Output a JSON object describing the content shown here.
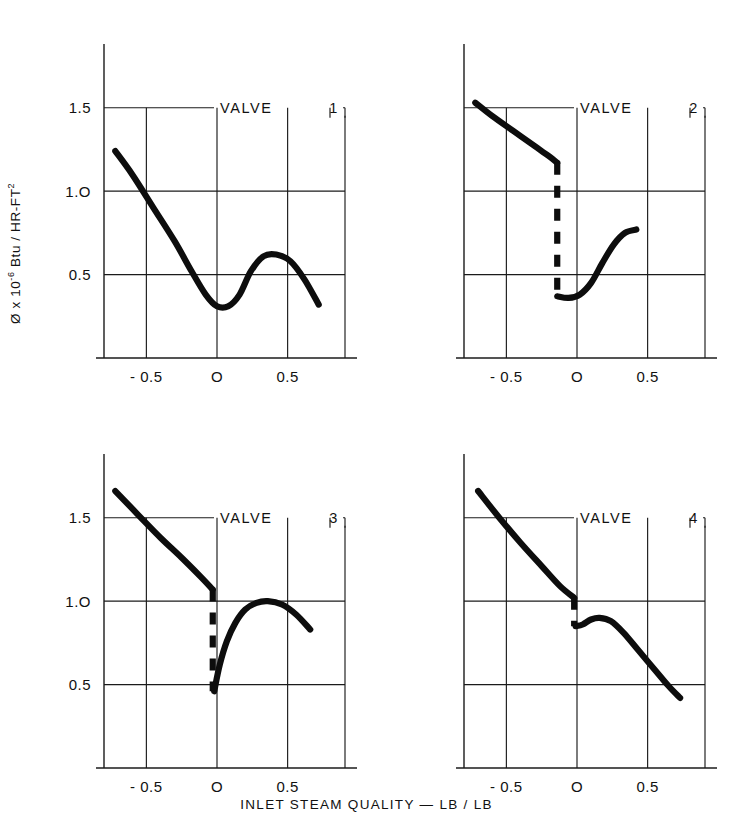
{
  "figure": {
    "ylabel": "Ø x 10",
    "ylabel_exponent": "-6",
    "ylabel_rest": " Btu / HR-FT",
    "ylabel_rest_exponent": "2",
    "xlabel": "INLET  STEAM  QUALITY  —  LB / LB",
    "ink_color": "#111111",
    "background_color": "#ffffff"
  },
  "chart_data": {
    "type": "line",
    "title": "",
    "xlabel": "INLET STEAM QUALITY — LB / LB",
    "ylabel": "Ø x 10^-6 Btu / HR-FT^2",
    "grid": true,
    "legend": "none",
    "panel_layout": "2x2",
    "panels": [
      {
        "name": "VALVE  1",
        "title_label": "VALVE",
        "title_number": "1",
        "xlim": [
          -0.8,
          0.8
        ],
        "ylim": [
          0.0,
          1.75
        ],
        "xticks": [
          -0.5,
          0,
          0.5
        ],
        "xticklabels": [
          "- 0.5",
          "O",
          "0.5"
        ],
        "yticks": [
          0.5,
          1.0,
          1.5
        ],
        "yticklabels": [
          "0.5",
          "1.O",
          "1.5"
        ],
        "gridline_y": [
          0.5,
          1.0,
          1.5
        ],
        "gridline_x": [
          -0.5,
          0.0,
          0.5
        ],
        "series": [
          {
            "name": "heat-flux-curve",
            "style": "solid",
            "x": [
              -0.72,
              -0.6,
              -0.45,
              -0.3,
              -0.18,
              -0.08,
              0.0,
              0.08,
              0.16,
              0.24,
              0.33,
              0.42,
              0.52,
              0.62,
              0.72
            ],
            "y": [
              1.24,
              1.1,
              0.9,
              0.7,
              0.52,
              0.38,
              0.31,
              0.31,
              0.38,
              0.52,
              0.61,
              0.62,
              0.58,
              0.47,
              0.32
            ]
          }
        ]
      },
      {
        "name": "VALVE  2",
        "title_label": "VALVE",
        "title_number": "2",
        "xlim": [
          -0.8,
          0.8
        ],
        "ylim": [
          0.0,
          1.75
        ],
        "xticks": [
          -0.5,
          0,
          0.5
        ],
        "xticklabels": [
          "- 0.5",
          "O",
          "0.5"
        ],
        "yticks": [
          0.5,
          1.0,
          1.5
        ],
        "yticklabels": [
          "",
          "",
          ""
        ],
        "gridline_y": [
          0.5,
          1.0,
          1.5
        ],
        "gridline_x": [
          -0.5,
          0.0,
          0.5
        ],
        "series": [
          {
            "name": "subcooled-branch",
            "style": "solid",
            "x": [
              -0.72,
              -0.6,
              -0.45,
              -0.3,
              -0.2,
              -0.14
            ],
            "y": [
              1.53,
              1.45,
              1.36,
              1.27,
              1.21,
              1.17
            ]
          },
          {
            "name": "transition-jump",
            "style": "dashed",
            "x": [
              -0.14,
              -0.14
            ],
            "y": [
              1.17,
              0.37
            ]
          },
          {
            "name": "quality-branch",
            "style": "solid",
            "x": [
              -0.14,
              -0.06,
              0.02,
              0.1,
              0.18,
              0.26,
              0.34,
              0.42
            ],
            "y": [
              0.37,
              0.36,
              0.38,
              0.45,
              0.57,
              0.68,
              0.75,
              0.77
            ]
          }
        ]
      },
      {
        "name": "VALVE  3",
        "title_label": "VALVE",
        "title_number": "3",
        "xlim": [
          -0.8,
          0.8
        ],
        "ylim": [
          0.0,
          1.75
        ],
        "xticks": [
          -0.5,
          0,
          0.5
        ],
        "xticklabels": [
          "- 0.5",
          "O",
          "0.5"
        ],
        "yticks": [
          0.5,
          1.0,
          1.5
        ],
        "yticklabels": [
          "0.5",
          "1.O",
          "1.5"
        ],
        "gridline_y": [
          0.5,
          1.0,
          1.5
        ],
        "gridline_x": [
          -0.5,
          0.0,
          0.5
        ],
        "series": [
          {
            "name": "subcooled-branch",
            "style": "solid",
            "x": [
              -0.72,
              -0.55,
              -0.4,
              -0.25,
              -0.12,
              -0.03
            ],
            "y": [
              1.66,
              1.51,
              1.38,
              1.26,
              1.15,
              1.07
            ]
          },
          {
            "name": "transition-jump",
            "style": "dashed",
            "x": [
              -0.03,
              -0.03
            ],
            "y": [
              1.07,
              0.46
            ]
          },
          {
            "name": "quality-branch",
            "style": "solid",
            "x": [
              -0.02,
              0.02,
              0.07,
              0.13,
              0.2,
              0.28,
              0.36,
              0.46,
              0.56,
              0.66
            ],
            "y": [
              0.46,
              0.62,
              0.76,
              0.87,
              0.95,
              0.99,
              1.0,
              0.98,
              0.92,
              0.83
            ]
          }
        ]
      },
      {
        "name": "VALVE  4",
        "title_label": "VALVE",
        "title_number": "4",
        "xlim": [
          -0.8,
          0.8
        ],
        "ylim": [
          0.0,
          1.75
        ],
        "xticks": [
          -0.5,
          0,
          0.5
        ],
        "xticklabels": [
          "- 0.5",
          "O",
          "0.5"
        ],
        "yticks": [
          0.5,
          1.0,
          1.5
        ],
        "yticklabels": [
          "",
          "",
          ""
        ],
        "gridline_y": [
          0.5,
          1.0,
          1.5
        ],
        "gridline_x": [
          -0.5,
          0.0,
          0.5
        ],
        "series": [
          {
            "name": "subcooled-branch",
            "style": "solid",
            "x": [
              -0.7,
              -0.55,
              -0.4,
              -0.25,
              -0.12,
              -0.02
            ],
            "y": [
              1.66,
              1.5,
              1.35,
              1.21,
              1.09,
              1.02
            ]
          },
          {
            "name": "transition-jump",
            "style": "dashed",
            "x": [
              -0.02,
              -0.02
            ],
            "y": [
              1.02,
              0.85
            ]
          },
          {
            "name": "quality-branch",
            "style": "solid",
            "x": [
              -0.01,
              0.04,
              0.1,
              0.16,
              0.24,
              0.33,
              0.43,
              0.54,
              0.65,
              0.73
            ],
            "y": [
              0.85,
              0.86,
              0.89,
              0.9,
              0.88,
              0.81,
              0.71,
              0.6,
              0.49,
              0.42
            ]
          }
        ]
      }
    ]
  }
}
